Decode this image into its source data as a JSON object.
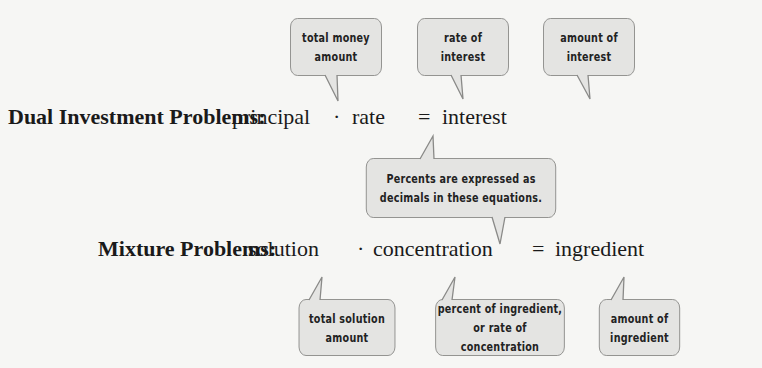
{
  "investment": {
    "label": "Dual Investment Problems:",
    "term1": "principal",
    "op1": "·",
    "term2": "rate",
    "op2": "=",
    "term3": "interest",
    "callouts": [
      {
        "text": "total money\namount"
      },
      {
        "text": "rate of\ninterest"
      },
      {
        "text": "amount of\ninterest"
      }
    ]
  },
  "note": {
    "text": "Percents are expressed as\ndecimals in these equations."
  },
  "mixture": {
    "label": "Mixture Problems:",
    "term1": "solution",
    "op1": "·",
    "term2": "concentration",
    "op2": "=",
    "term3": "ingredient",
    "callouts": [
      {
        "text": "total solution\namount"
      },
      {
        "text": "percent of ingredient,\nor rate of concentration"
      },
      {
        "text": "amount of\ningredient"
      }
    ]
  }
}
